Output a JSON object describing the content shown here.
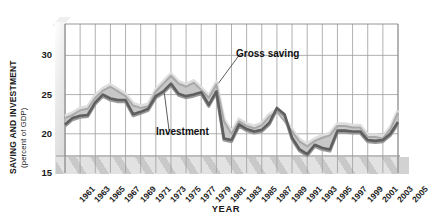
{
  "chart_data": {
    "type": "area",
    "title": "",
    "xlabel": "YEAR",
    "ylabel": "SAVING AND INVESTMENT",
    "ylabel_sub": "(percent of GDP)",
    "ylim": [
      15,
      34
    ],
    "yticks": [
      15,
      20,
      25,
      30
    ],
    "xlim": [
      1961,
      2005
    ],
    "grid": "vertical every 2 years, horizontal at 20/25/30",
    "legend": "inline annotations with leader lines",
    "annotations": [
      {
        "label": "Gross saving",
        "points_to_year": 1981
      },
      {
        "label": "Investment",
        "points_to_year": 1974
      }
    ],
    "x": [
      1961,
      1962,
      1963,
      1964,
      1965,
      1966,
      1967,
      1968,
      1969,
      1970,
      1971,
      1972,
      1973,
      1974,
      1975,
      1976,
      1977,
      1978,
      1979,
      1980,
      1981,
      1982,
      1983,
      1984,
      1985,
      1986,
      1987,
      1988,
      1989,
      1990,
      1991,
      1992,
      1993,
      1994,
      1995,
      1996,
      1997,
      1998,
      1999,
      2000,
      2001,
      2002,
      2003,
      2004,
      2005
    ],
    "xtick_labels": [
      "1961",
      "1963",
      "1965",
      "1967",
      "1969",
      "1971",
      "1973",
      "1975",
      "1977",
      "1979",
      "1981",
      "1983",
      "1985",
      "1987",
      "1989",
      "1991",
      "1993",
      "1995",
      "1997",
      "1999",
      "2001",
      "2003",
      "2005"
    ],
    "series": [
      {
        "name": "Gross saving",
        "color": "#b9b9b9",
        "values": [
          22.0,
          22.4,
          23.0,
          23.2,
          24.6,
          25.5,
          26.0,
          25.4,
          24.8,
          23.6,
          23.3,
          23.5,
          25.4,
          26.4,
          27.4,
          26.4,
          26.0,
          26.5,
          25.6,
          24.6,
          26.3,
          21.6,
          20.0,
          21.6,
          21.0,
          20.7,
          21.1,
          22.2,
          22.8,
          21.6,
          20.3,
          19.0,
          18.4,
          19.1,
          19.5,
          19.8,
          21.0,
          21.0,
          20.8,
          20.8,
          19.6,
          19.6,
          19.4,
          20.6,
          22.7
        ]
      },
      {
        "name": "Investment",
        "color": "#6e6e6e",
        "values": [
          21.2,
          22.0,
          22.3,
          22.4,
          24.0,
          25.0,
          24.5,
          24.3,
          24.3,
          22.5,
          22.8,
          23.2,
          24.8,
          25.4,
          26.4,
          25.1,
          24.8,
          25.0,
          25.3,
          23.7,
          25.4,
          19.4,
          19.2,
          21.2,
          20.6,
          20.3,
          20.5,
          21.4,
          23.3,
          22.5,
          19.5,
          18.0,
          17.4,
          18.6,
          18.2,
          18.0,
          20.4,
          20.4,
          20.3,
          20.3,
          19.2,
          19.1,
          19.2,
          20.0,
          21.5
        ]
      }
    ]
  }
}
